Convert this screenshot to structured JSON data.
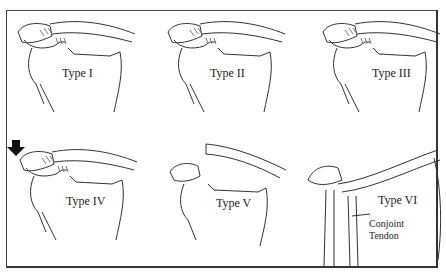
{
  "diagram": {
    "title": "",
    "panels": [
      {
        "id": "type-1",
        "label": "Type I"
      },
      {
        "id": "type-2",
        "label": "Type II"
      },
      {
        "id": "type-3",
        "label": "Type III"
      },
      {
        "id": "type-4",
        "label": "Type IV",
        "annotation": "down-arrow"
      },
      {
        "id": "type-5",
        "label": "Type V"
      },
      {
        "id": "type-6",
        "label": "Type VI",
        "callout": "Conjoint Tendon"
      }
    ],
    "callout": {
      "line1": "Conjoint",
      "line2": "Tendon"
    },
    "colors": {
      "line": "#333333",
      "border": "#444444",
      "background": "#ffffff"
    }
  }
}
